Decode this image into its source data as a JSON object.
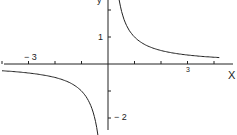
{
  "chart_data": {
    "type": "line",
    "title": "",
    "xlabel": "x",
    "ylabel": "y",
    "function": "y = 1/x",
    "xlim": [
      -4.1,
      4.8
    ],
    "ylim": [
      -2.6,
      2.4
    ],
    "x_ticks": [
      -4,
      -3,
      -2,
      -1,
      1,
      2,
      3,
      4
    ],
    "y_ticks": [
      -2,
      -1,
      1,
      2
    ],
    "x_tick_labels": {
      "-3": "− 3",
      "3": "3"
    },
    "y_tick_labels": {
      "1": "1",
      "-2": "− 2"
    },
    "grid": false,
    "series": [
      {
        "name": "1/x (x>0)",
        "x": [
          0.4,
          0.5,
          0.75,
          1,
          1.5,
          2,
          3,
          4.2
        ],
        "y": [
          2.5,
          2,
          1.333,
          1,
          0.667,
          0.5,
          0.333,
          0.238
        ]
      },
      {
        "name": "1/x (x<0)",
        "x": [
          -4,
          -3,
          -2,
          -1.5,
          -1,
          -0.75,
          -0.5,
          -0.4
        ],
        "y": [
          -0.25,
          -0.333,
          -0.5,
          -0.667,
          -1,
          -1.333,
          -2,
          -2.5
        ]
      }
    ]
  },
  "labels": {
    "x_axis": "X",
    "y_axis": "y",
    "x_neg3": "− 3",
    "x_pos3": "3",
    "y_pos1": "1",
    "y_neg2": "− 2"
  }
}
